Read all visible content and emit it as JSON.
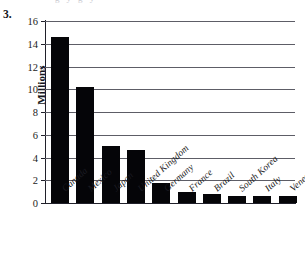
{
  "exercise": {
    "number": "3."
  },
  "clipped_text_above": "g   y  g  y",
  "chart_data": {
    "type": "bar",
    "title": "",
    "subtitle": "",
    "xlabel": "",
    "ylabel": "Millions",
    "categories": [
      "Canada",
      "Mexico",
      "Japan",
      "United Kingdom",
      "Germany",
      "France",
      "Brazil",
      "South Korea",
      "Italy",
      "Venezuela"
    ],
    "values": [
      14.6,
      10.2,
      5.0,
      4.7,
      1.8,
      1.0,
      0.8,
      0.65,
      0.6,
      0.6
    ],
    "ylim": [
      0,
      16
    ],
    "ytick_labels": [
      "0",
      "2",
      "4",
      "6",
      "8",
      "10",
      "12",
      "14",
      "16"
    ],
    "ytick_values": [
      0,
      2,
      4,
      6,
      8,
      10,
      12,
      14,
      16
    ],
    "grid": "horizontal",
    "legend": "none",
    "bar_color": "#050508",
    "gridline_color": "#5d5d66",
    "axis_color": "#20202a",
    "background": "#ffffff"
  }
}
